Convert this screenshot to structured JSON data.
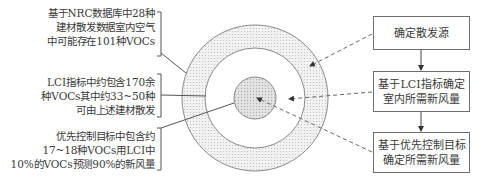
{
  "diagram": {
    "type": "concentric-circles-with-flow",
    "left_notes": [
      {
        "id": "note-outer",
        "lines": [
          "基于NRC数据库中28种",
          "建材散发数据室内空气",
          "中可能存在101种VOCs"
        ],
        "points_to": "outer-ring"
      },
      {
        "id": "note-middle",
        "lines": [
          "LCI指标中约包含170余",
          "种VOCs其中约33~50种",
          "可由上述建材散发"
        ],
        "points_to": "middle-ring"
      },
      {
        "id": "note-inner",
        "lines": [
          "优先控制目标中包含约",
          "17~18种VOCs用LCI中",
          "10%的VOCs预测90%的新风量"
        ],
        "points_to": "inner-circle"
      }
    ],
    "circles": {
      "center": [
        255,
        98
      ],
      "outer_radius": 73,
      "middle_radius": 50,
      "inner_radius": 21,
      "fill_color": "#e6e6e6",
      "stroke_color": "#8a8a8a"
    },
    "right_boxes": [
      {
        "id": "box-1",
        "lines": [
          "确定散发源"
        ],
        "arrow_target": "outer-ring"
      },
      {
        "id": "box-2",
        "lines": [
          "基于LCI指标确定",
          "室内所需新风量"
        ],
        "arrow_target": "middle-ring"
      },
      {
        "id": "box-3",
        "lines": [
          "基于优先控制目标",
          "确定所需新风量"
        ],
        "arrow_target": "inner-circle"
      }
    ],
    "flow": [
      "box-1",
      "box-2",
      "box-3"
    ]
  }
}
